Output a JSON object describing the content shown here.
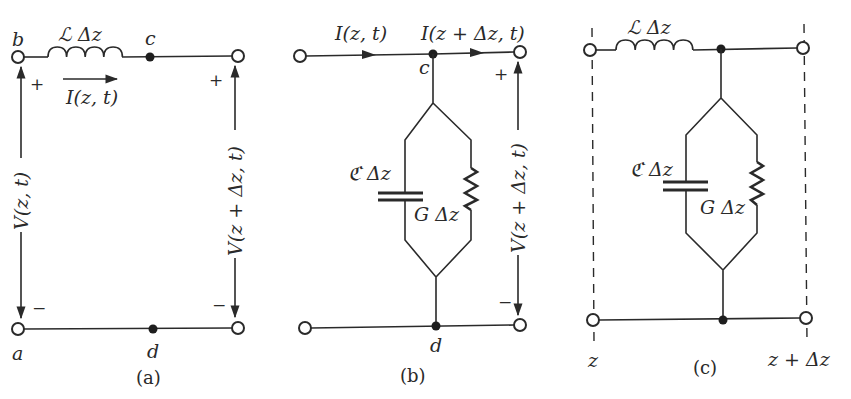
{
  "figure": {
    "panels": [
      {
        "id": "a",
        "caption": "(a)",
        "nodes": {
          "top_left": "b",
          "top_mid": "c",
          "bottom_left": "a",
          "bottom_mid": "d"
        },
        "series_element": "ℒ Δz",
        "current_label": "I(z, t)",
        "voltage_left": "V(z, t)",
        "voltage_right": "V(z + Δz, t)",
        "plus": "+",
        "minus": "−"
      },
      {
        "id": "b",
        "caption": "(b)",
        "nodes": {
          "top_mid": "c",
          "bottom_mid": "d"
        },
        "current_in": "I(z, t)",
        "current_out": "I(z + Δz, t)",
        "shunt_capacitor": "ℭ Δz",
        "shunt_conductance": "G Δz",
        "voltage_right": "V(z + Δz, t)",
        "plus": "+",
        "minus": "−"
      },
      {
        "id": "c",
        "caption": "(c)",
        "series_element": "ℒ Δz",
        "shunt_capacitor": "ℭ Δz",
        "shunt_conductance": "G Δz",
        "position_left": "z",
        "position_right": "z + Δz"
      }
    ]
  },
  "colors": {
    "ink": "#2a2a2a",
    "background": "#ffffff"
  }
}
